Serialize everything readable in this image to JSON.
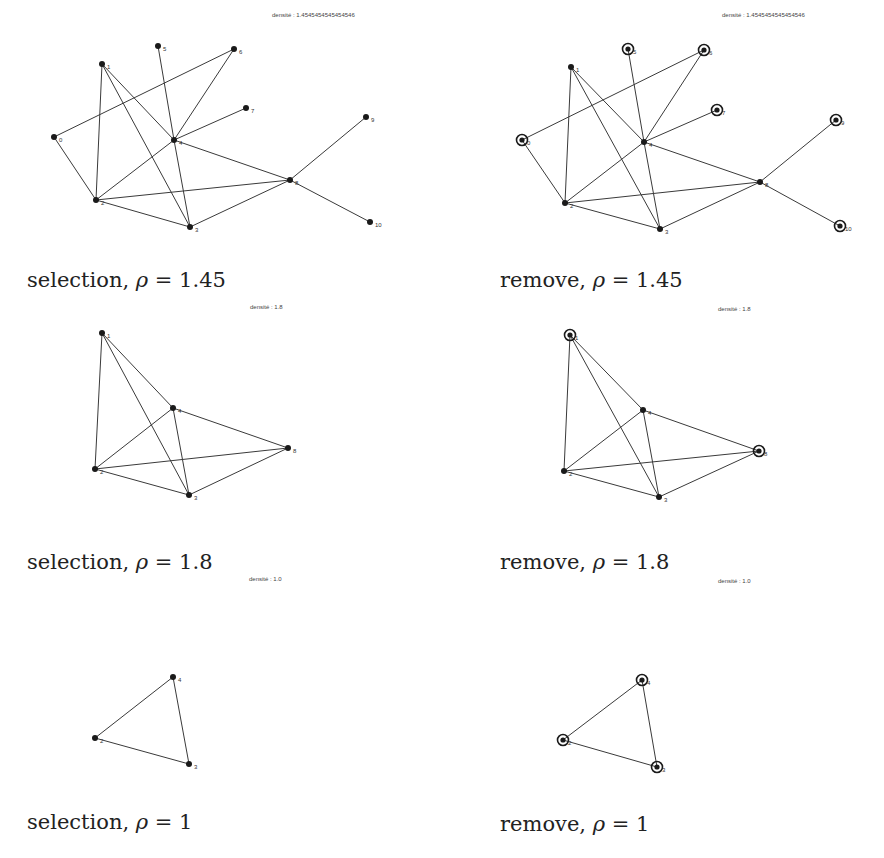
{
  "figure": {
    "panels": [
      {
        "id": "selection-1",
        "caption": {
          "prefix": "selection, ",
          "symbol": "ρ",
          "suffix": " = 1.45"
        },
        "density_label": "densité : 1.4545454545454546",
        "origin": [
          0,
          0
        ],
        "density_pos": [
          272,
          12
        ],
        "caption_pos": [
          27,
          268
        ],
        "nodes": [
          {
            "id": "0",
            "x": 54,
            "y": 137,
            "ring": false
          },
          {
            "id": "1",
            "x": 102,
            "y": 64,
            "ring": false
          },
          {
            "id": "2",
            "x": 96,
            "y": 200,
            "ring": false
          },
          {
            "id": "3",
            "x": 190,
            "y": 227,
            "ring": false
          },
          {
            "id": "4",
            "x": 174,
            "y": 140,
            "ring": false
          },
          {
            "id": "5",
            "x": 158,
            "y": 46,
            "ring": false
          },
          {
            "id": "6",
            "x": 234,
            "y": 49,
            "ring": false
          },
          {
            "id": "7",
            "x": 246,
            "y": 108,
            "ring": false
          },
          {
            "id": "8",
            "x": 290,
            "y": 180,
            "ring": false
          },
          {
            "id": "9",
            "x": 366,
            "y": 117,
            "ring": false
          },
          {
            "id": "10",
            "x": 370,
            "y": 222,
            "ring": false
          }
        ],
        "edges": [
          [
            "0",
            "6"
          ],
          [
            "0",
            "2"
          ],
          [
            "1",
            "2"
          ],
          [
            "1",
            "3"
          ],
          [
            "1",
            "4"
          ],
          [
            "5",
            "4"
          ],
          [
            "4",
            "3"
          ],
          [
            "6",
            "4"
          ],
          [
            "4",
            "7"
          ],
          [
            "4",
            "2"
          ],
          [
            "4",
            "8"
          ],
          [
            "2",
            "8"
          ],
          [
            "2",
            "3"
          ],
          [
            "3",
            "8"
          ],
          [
            "8",
            "9"
          ],
          [
            "8",
            "10"
          ]
        ]
      },
      {
        "id": "remove-1",
        "caption": {
          "prefix": "remove, ",
          "symbol": "ρ",
          "suffix": " = 1.45"
        },
        "density_label": "densité : 1.4545454545454546",
        "origin": [
          0,
          0
        ],
        "density_pos": [
          722,
          12
        ],
        "caption_pos": [
          500,
          268
        ],
        "nodes": [
          {
            "id": "0",
            "x": 522,
            "y": 140,
            "ring": true
          },
          {
            "id": "1",
            "x": 571,
            "y": 67,
            "ring": false
          },
          {
            "id": "2",
            "x": 565,
            "y": 203,
            "ring": false
          },
          {
            "id": "3",
            "x": 660,
            "y": 229,
            "ring": false
          },
          {
            "id": "4",
            "x": 644,
            "y": 142,
            "ring": false
          },
          {
            "id": "5",
            "x": 628,
            "y": 49,
            "ring": true
          },
          {
            "id": "6",
            "x": 704,
            "y": 50,
            "ring": true
          },
          {
            "id": "7",
            "x": 717,
            "y": 110,
            "ring": true
          },
          {
            "id": "8",
            "x": 760,
            "y": 182,
            "ring": false
          },
          {
            "id": "9",
            "x": 836,
            "y": 120,
            "ring": true
          },
          {
            "id": "10",
            "x": 840,
            "y": 226,
            "ring": true
          }
        ],
        "edges": [
          [
            "0",
            "6"
          ],
          [
            "0",
            "2"
          ],
          [
            "1",
            "2"
          ],
          [
            "1",
            "3"
          ],
          [
            "1",
            "4"
          ],
          [
            "5",
            "4"
          ],
          [
            "4",
            "3"
          ],
          [
            "6",
            "4"
          ],
          [
            "4",
            "7"
          ],
          [
            "4",
            "2"
          ],
          [
            "4",
            "8"
          ],
          [
            "2",
            "8"
          ],
          [
            "2",
            "3"
          ],
          [
            "3",
            "8"
          ],
          [
            "8",
            "9"
          ],
          [
            "8",
            "10"
          ]
        ]
      },
      {
        "id": "selection-2",
        "caption": {
          "prefix": "selection, ",
          "symbol": "ρ",
          "suffix": " = 1.8"
        },
        "density_label": "densité : 1.8",
        "origin": [
          0,
          0
        ],
        "density_pos": [
          250,
          304
        ],
        "caption_pos": [
          27,
          550
        ],
        "nodes": [
          {
            "id": "1",
            "x": 102,
            "y": 333,
            "ring": false
          },
          {
            "id": "2",
            "x": 95,
            "y": 469,
            "ring": false
          },
          {
            "id": "3",
            "x": 189,
            "y": 495,
            "ring": false
          },
          {
            "id": "4",
            "x": 173,
            "y": 408,
            "ring": false
          },
          {
            "id": "8",
            "x": 288,
            "y": 448,
            "ring": false
          }
        ],
        "edges": [
          [
            "1",
            "2"
          ],
          [
            "1",
            "3"
          ],
          [
            "1",
            "4"
          ],
          [
            "4",
            "2"
          ],
          [
            "4",
            "3"
          ],
          [
            "4",
            "8"
          ],
          [
            "2",
            "8"
          ],
          [
            "2",
            "3"
          ],
          [
            "3",
            "8"
          ]
        ]
      },
      {
        "id": "remove-2",
        "caption": {
          "prefix": "remove, ",
          "symbol": "ρ",
          "suffix": " = 1.8"
        },
        "density_label": "densité : 1.8",
        "origin": [
          0,
          0
        ],
        "density_pos": [
          718,
          306
        ],
        "caption_pos": [
          500,
          550
        ],
        "nodes": [
          {
            "id": "1",
            "x": 570,
            "y": 335,
            "ring": true
          },
          {
            "id": "2",
            "x": 564,
            "y": 471,
            "ring": false
          },
          {
            "id": "3",
            "x": 659,
            "y": 497,
            "ring": false
          },
          {
            "id": "4",
            "x": 643,
            "y": 410,
            "ring": false
          },
          {
            "id": "8",
            "x": 759,
            "y": 451,
            "ring": true
          }
        ],
        "edges": [
          [
            "1",
            "2"
          ],
          [
            "1",
            "3"
          ],
          [
            "1",
            "4"
          ],
          [
            "4",
            "2"
          ],
          [
            "4",
            "3"
          ],
          [
            "4",
            "8"
          ],
          [
            "2",
            "8"
          ],
          [
            "2",
            "3"
          ],
          [
            "3",
            "8"
          ]
        ]
      },
      {
        "id": "selection-3",
        "caption": {
          "prefix": "selection, ",
          "symbol": "ρ",
          "suffix": " = 1"
        },
        "density_label": "densité : 1.0",
        "origin": [
          0,
          0
        ],
        "density_pos": [
          249,
          576
        ],
        "caption_pos": [
          27,
          810
        ],
        "nodes": [
          {
            "id": "2",
            "x": 95,
            "y": 738,
            "ring": false
          },
          {
            "id": "3",
            "x": 189,
            "y": 764,
            "ring": false
          },
          {
            "id": "4",
            "x": 173,
            "y": 677,
            "ring": false
          }
        ],
        "edges": [
          [
            "2",
            "4"
          ],
          [
            "2",
            "3"
          ],
          [
            "4",
            "3"
          ]
        ]
      },
      {
        "id": "remove-3",
        "caption": {
          "prefix": "remove, ",
          "symbol": "ρ",
          "suffix": " = 1"
        },
        "density_label": "densité : 1.0",
        "origin": [
          0,
          0
        ],
        "density_pos": [
          718,
          578
        ],
        "caption_pos": [
          500,
          812
        ],
        "nodes": [
          {
            "id": "2",
            "x": 563,
            "y": 740,
            "ring": true
          },
          {
            "id": "3",
            "x": 657,
            "y": 767,
            "ring": true
          },
          {
            "id": "4",
            "x": 642,
            "y": 680,
            "ring": true
          }
        ],
        "edges": [
          [
            "2",
            "4"
          ],
          [
            "2",
            "3"
          ],
          [
            "4",
            "3"
          ]
        ]
      }
    ]
  }
}
